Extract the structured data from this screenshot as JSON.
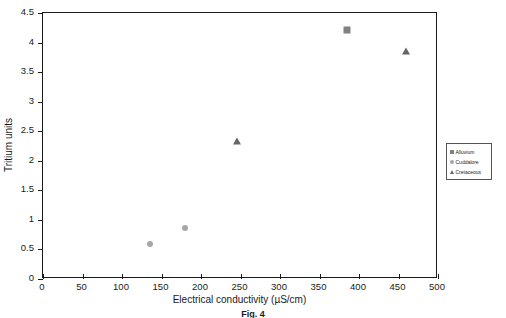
{
  "chart_data": {
    "type": "scatter",
    "title": "",
    "xlabel": "Electrical conductivity (µS/cm)",
    "ylabel": "Tritium units",
    "xlim": [
      0,
      500
    ],
    "ylim": [
      0,
      4.5
    ],
    "xticks": [
      "0",
      "50",
      "100",
      "150",
      "200",
      "250",
      "300",
      "350",
      "400",
      "450",
      "500"
    ],
    "xtick_values": [
      0,
      50,
      100,
      150,
      200,
      250,
      300,
      350,
      400,
      450,
      500
    ],
    "yticks": [
      "0",
      "0.5",
      "1",
      "1.5",
      "2",
      "2.5",
      "3",
      "3.5",
      "4",
      "4.5"
    ],
    "ytick_values": [
      0,
      0.5,
      1,
      1.5,
      2,
      2.5,
      3,
      3.5,
      4,
      4.5
    ],
    "grid": false,
    "legend_position": "right-outside",
    "series": [
      {
        "name": "Alluvium",
        "marker": "square",
        "color": "#808080",
        "points": [
          {
            "x": 385,
            "y": 4.22
          }
        ]
      },
      {
        "name": "Cuddalore",
        "marker": "circle",
        "color": "#a6a6a6",
        "points": [
          {
            "x": 135,
            "y": 0.6
          },
          {
            "x": 180,
            "y": 0.87
          }
        ]
      },
      {
        "name": "Cretaceous",
        "marker": "triangle",
        "color": "#666666",
        "points": [
          {
            "x": 245,
            "y": 2.33
          },
          {
            "x": 460,
            "y": 3.85
          }
        ]
      }
    ]
  },
  "legend": {
    "items": [
      {
        "label": "Alluvium",
        "marker": "square",
        "color": "#808080"
      },
      {
        "label": "Cuddalore",
        "marker": "circle",
        "color": "#a6a6a6"
      },
      {
        "label": "Cretaceous",
        "marker": "triangle",
        "color": "#666666"
      }
    ]
  },
  "caption": "Fig. 4"
}
